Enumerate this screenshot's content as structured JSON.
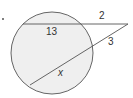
{
  "problem_marker": "•",
  "diagram": {
    "type": "circle-with-two-secants",
    "colors": {
      "circle_fill": "#efefef",
      "stroke": "#555555",
      "label": "#333333"
    },
    "circle": {
      "cx": 52,
      "cy": 53,
      "r": 41
    },
    "external_point": {
      "x": 128,
      "y": 24
    },
    "secants": [
      {
        "name": "upper-secant",
        "far_intersection": {
          "x": 23,
          "y": 24
        },
        "near_intersection": {
          "x": 79,
          "y": 24
        },
        "external_label": "2",
        "internal_label": "13"
      },
      {
        "name": "lower-secant",
        "far_intersection": {
          "x": 30,
          "y": 85
        },
        "near_intersection": {
          "x": 91,
          "y": 47
        },
        "external_label": "3",
        "internal_label": "x"
      }
    ]
  },
  "labels": {
    "upper_external": "2",
    "upper_internal": "13",
    "lower_external": "3",
    "lower_internal": "x"
  }
}
